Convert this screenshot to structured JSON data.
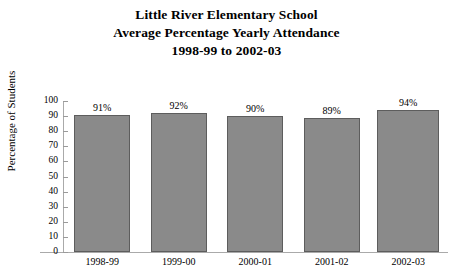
{
  "chart_data": {
    "type": "bar",
    "title": "Little River Elementary School Average Percentage Yearly Attendance 1998-99 to 2002-03",
    "title_lines": [
      "Little River Elementary School",
      "Average Percentage Yearly Attendance",
      "1998-99 to 2002-03"
    ],
    "categories": [
      "1998-99",
      "1999-00",
      "2000-01",
      "2001-02",
      "2002-03"
    ],
    "values": [
      91,
      92,
      90,
      89,
      94
    ],
    "data_labels": [
      "91%",
      "92%",
      "90%",
      "89%",
      "94%"
    ],
    "xlabel": "",
    "ylabel": "Percentage of Students",
    "ylim": [
      0,
      100
    ],
    "ytick_step": 10,
    "ytick_labels": [
      "100",
      "90",
      "80",
      "70",
      "60",
      "50",
      "40",
      "30",
      "20",
      "10",
      "0"
    ],
    "grid": false,
    "legend": false,
    "bar_color": "#8a8a8a",
    "bar_edge_color": "#5d5d5d",
    "axis_color": "#aaaaaa",
    "background_color": "#ffffff",
    "text_color": "#000000"
  }
}
